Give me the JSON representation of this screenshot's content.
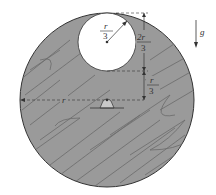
{
  "diagram": {
    "labels": {
      "hole_radius_num": "r",
      "hole_radius_den": "3",
      "upper_dim_num": "2r",
      "upper_dim_den": "3",
      "lower_dim_num": "r",
      "lower_dim_den": "3",
      "disk_radius": "r",
      "gravity": "g"
    },
    "colors": {
      "disk_fill": "#9a9a9a",
      "wood_grain": "#6a6a6a",
      "hole_fill": "#ffffff",
      "line": "#333333",
      "pivot_fill": "#c8c8c8"
    }
  }
}
